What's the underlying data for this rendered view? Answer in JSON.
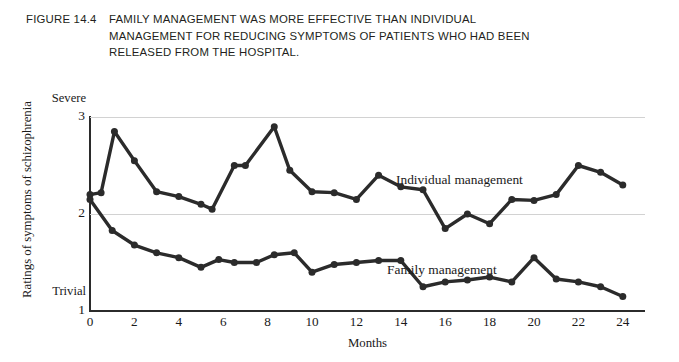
{
  "figure": {
    "number": "FIGURE 14.4",
    "caption": "FAMILY MANAGEMENT WAS MORE EFFECTIVE THAN INDIVIDUAL MANAGEMENT FOR REDUCING SYMPTOMS OF PATIENTS WHO HAD BEEN RELEASED FROM THE HOSPITAL."
  },
  "axis": {
    "y_title": "Ratings of symptoms of schizophrenia",
    "y_top_anchor": "Severe",
    "y_bottom_anchor": "Trivial",
    "y_ticks": [
      "3",
      "2",
      "1"
    ],
    "x_title": "Months",
    "x_ticks": [
      "0",
      "2",
      "4",
      "6",
      "8",
      "10",
      "12",
      "14",
      "16",
      "18",
      "20",
      "22",
      "24"
    ]
  },
  "labels": {
    "individual": "Individual management",
    "family": "Family management"
  },
  "colors": {
    "line": "#2b2b2b",
    "grid": "#d2d2d2",
    "text": "#1a1a1a",
    "caption": "#231f20",
    "background": "#ffffff"
  },
  "chart_data": {
    "type": "line",
    "title": "FAMILY MANAGEMENT WAS MORE EFFECTIVE THAN INDIVIDUAL MANAGEMENT FOR REDUCING SYMPTOMS OF PATIENTS WHO HAD BEEN RELEASED FROM THE HOSPITAL.",
    "xlabel": "Months",
    "ylabel": "Ratings of symptoms of schizophrenia",
    "xlim": [
      0,
      25
    ],
    "ylim": [
      1,
      3
    ],
    "grid": true,
    "gridlines_y": [
      2,
      3
    ],
    "legend": "inline-annotations",
    "y_anchor_high": "Severe",
    "y_anchor_low": "Trivial",
    "series": [
      {
        "name": "Individual management",
        "x": [
          0,
          0.5,
          1.1,
          2,
          3,
          4,
          5,
          5.5,
          6.5,
          7,
          8.3,
          9,
          10,
          11,
          12,
          13,
          14,
          15,
          16,
          17,
          18,
          19,
          20,
          21,
          22,
          23,
          24
        ],
        "values": [
          2.2,
          2.22,
          2.85,
          2.55,
          2.23,
          2.18,
          2.1,
          2.05,
          2.5,
          2.5,
          2.9,
          2.45,
          2.23,
          2.22,
          2.15,
          2.4,
          2.28,
          2.25,
          1.85,
          2.0,
          1.9,
          2.15,
          2.14,
          2.2,
          2.5,
          2.43,
          2.3
        ]
      },
      {
        "name": "Family management",
        "x": [
          0,
          1,
          2,
          3,
          4,
          5,
          5.8,
          6.5,
          7.5,
          8.3,
          9.2,
          10,
          11,
          12,
          13,
          14,
          15,
          16,
          17,
          18,
          19,
          20,
          21,
          22,
          23,
          24
        ],
        "values": [
          2.15,
          1.83,
          1.68,
          1.6,
          1.55,
          1.45,
          1.53,
          1.5,
          1.5,
          1.58,
          1.6,
          1.4,
          1.48,
          1.5,
          1.52,
          1.52,
          1.25,
          1.3,
          1.32,
          1.35,
          1.3,
          1.55,
          1.33,
          1.3,
          1.25,
          1.15
        ]
      }
    ]
  }
}
